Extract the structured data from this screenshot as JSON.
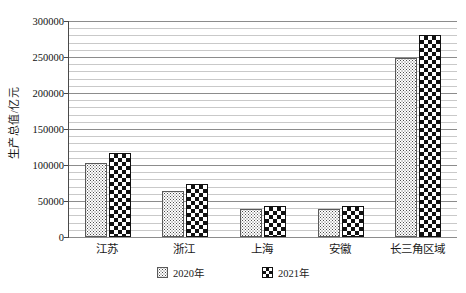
{
  "chart_data": {
    "type": "bar",
    "title": "",
    "xlabel": "",
    "ylabel": "生产总值/亿元",
    "categories": [
      "江苏",
      "浙江",
      "上海",
      "安徽",
      "长三角区域"
    ],
    "series": [
      {
        "name": "2020年",
        "values": [
          102700,
          64600,
          38700,
          38600,
          248600
        ]
      },
      {
        "name": "2021年",
        "values": [
          116400,
          73500,
          43200,
          42900,
          280000
        ]
      }
    ],
    "ylim": [
      0,
      300000
    ],
    "yticks": [
      0,
      50000,
      100000,
      150000,
      200000,
      250000,
      300000
    ],
    "ytick_labels": [
      "0",
      "50000",
      "100000",
      "150000",
      "200000",
      "250000",
      "300000"
    ],
    "minor_tick_step": 10000,
    "grid": true,
    "legend_position": "bottom",
    "legend": [
      "2020年",
      "2021年"
    ]
  }
}
